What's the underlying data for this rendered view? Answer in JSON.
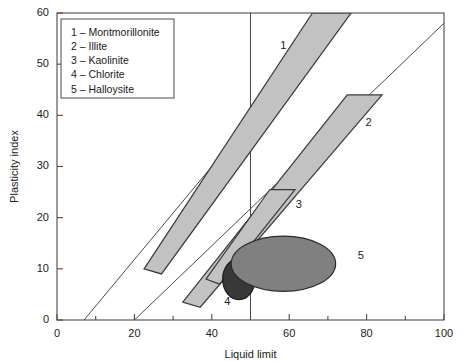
{
  "chart_data": {
    "type": "scatter",
    "title": "",
    "xlabel": "Liquid limit",
    "ylabel": "Plasticity index",
    "xlim": [
      0,
      100
    ],
    "ylim": [
      0,
      60
    ],
    "xticks": [
      0,
      20,
      40,
      60,
      80,
      100
    ],
    "xtick_labels": [
      "0",
      "20",
      "40",
      "60",
      "80",
      "100"
    ],
    "xminor_step": 10,
    "yticks": [
      0,
      10,
      20,
      30,
      40,
      50,
      60
    ],
    "ytick_labels": [
      "0",
      "10",
      "20",
      "30",
      "40",
      "50",
      "60"
    ],
    "grid": false,
    "legend_position": "top-left",
    "legend_entries": [
      "1 – Montmorillonite",
      "2 – Illite",
      "3 – Kaolinite",
      "4 – Chlorite",
      "5 – Halloysite"
    ],
    "reference_lines": [
      {
        "name": "A-line",
        "x_start": 20,
        "y_start": 0,
        "x_end": 100,
        "y_end": 58
      },
      {
        "name": "U-line",
        "x_start": 7,
        "y_start": 0,
        "x_end": 73,
        "y_end": 60
      },
      {
        "name": "LL-50-vertical",
        "x_start": 50,
        "y_start": 0,
        "x_end": 50,
        "y_end": 60
      }
    ],
    "regions": [
      {
        "id": 1,
        "name": "Montmorillonite",
        "shape": "band",
        "fill": "#c2c2c2",
        "stroke": "#3a3a3a",
        "label": "1",
        "label_at": [
          58.5,
          53.5
        ],
        "polygon_xy": [
          [
            22.5,
            10.0
          ],
          [
            66.0,
            60.0
          ],
          [
            76.0,
            60.0
          ],
          [
            27.0,
            9.0
          ]
        ]
      },
      {
        "id": 2,
        "name": "Illite",
        "shape": "band",
        "fill": "#c2c2c2",
        "stroke": "#3a3a3a",
        "label": "2",
        "label_at": [
          80.5,
          38.5
        ],
        "polygon_xy": [
          [
            32.5,
            3.5
          ],
          [
            75.0,
            44.0
          ],
          [
            84.0,
            44.0
          ],
          [
            37.0,
            2.5
          ]
        ]
      },
      {
        "id": 3,
        "name": "Kaolinite",
        "shape": "band",
        "fill": "#c2c2c2",
        "stroke": "#3a3a3a",
        "label": "3",
        "label_at": [
          62.5,
          22.5
        ],
        "polygon_xy": [
          [
            38.5,
            8.0
          ],
          [
            55.0,
            25.5
          ],
          [
            61.5,
            25.5
          ],
          [
            42.0,
            7.0
          ]
        ]
      },
      {
        "id": 4,
        "name": "Chlorite",
        "shape": "ellipse",
        "fill": "#383838",
        "stroke": "#1a1a1a",
        "label": "4",
        "label_at": [
          44.0,
          3.5
        ],
        "center_xy": [
          47.0,
          8.0
        ],
        "radius_xy": [
          4.2,
          4.0
        ]
      },
      {
        "id": 5,
        "name": "Halloysite",
        "shape": "ellipse",
        "fill": "#808080",
        "stroke": "#2a2a2a",
        "label": "5",
        "label_at": [
          78.5,
          12.5
        ],
        "center_xy": [
          58.5,
          11.0
        ],
        "radius_xy": [
          13.5,
          5.4
        ]
      }
    ]
  }
}
